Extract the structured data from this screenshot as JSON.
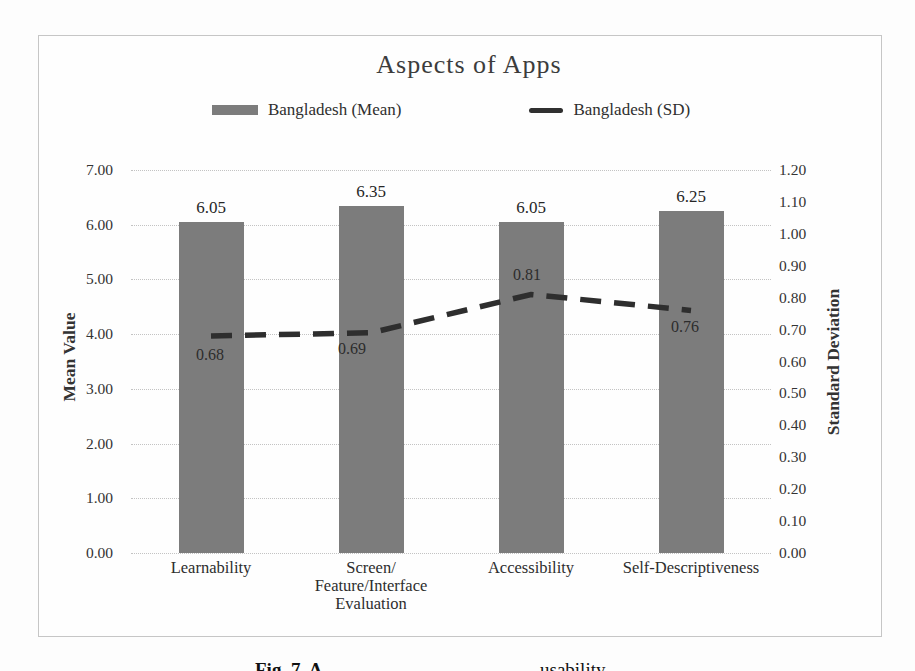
{
  "figure": {
    "caption": {
      "bold_fragment": "Fig. 7. A",
      "visible_fragment": "usability"
    }
  },
  "chart_data": {
    "type": "bar",
    "subtype": "combo-bar-line-dual-axis",
    "title": "Aspects of Apps",
    "categories": [
      "Learnability",
      "Screen/\nFeature/Interface\nEvaluation",
      "Accessibility",
      "Self-Descriptiveness"
    ],
    "series": [
      {
        "name": "Bangladesh (Mean)",
        "chart": "bar",
        "axis": "left",
        "values": [
          6.05,
          6.35,
          6.05,
          6.25
        ],
        "labels": [
          "6.05",
          "6.35",
          "6.05",
          "6.25"
        ],
        "color": "#7c7c7c"
      },
      {
        "name": "Bangladesh (SD)",
        "chart": "line",
        "axis": "right",
        "line_style": "dashed",
        "values": [
          0.68,
          0.69,
          0.81,
          0.76
        ],
        "labels": [
          "0.68",
          "0.69",
          "0.81",
          "0.76"
        ],
        "color": "#2e2e2e"
      }
    ],
    "left_axis": {
      "title": "Mean Value",
      "min": 0.0,
      "max": 7.0,
      "step": 1.0,
      "tick_labels": [
        "7.00",
        "6.00",
        "5.00",
        "4.00",
        "3.00",
        "2.00",
        "1.00",
        "0.00"
      ]
    },
    "right_axis": {
      "title": "Standard Deviation",
      "min": 0.0,
      "max": 1.2,
      "step": 0.1,
      "tick_labels": [
        "1.20",
        "1.10",
        "1.00",
        "0.90",
        "0.80",
        "0.70",
        "0.60",
        "0.50",
        "0.40",
        "0.30",
        "0.20",
        "0.10",
        "0.00"
      ]
    },
    "legend": {
      "position": "top",
      "entries": [
        "Bangladesh (Mean)",
        "Bangladesh (SD)"
      ]
    },
    "grid": true
  }
}
